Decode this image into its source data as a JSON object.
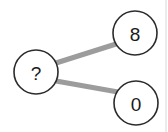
{
  "figure": {
    "type": "node-link-diagram",
    "title": "",
    "background_color": "#ffffff",
    "width": 168,
    "height": 132
  },
  "style": {
    "node_fill": "#ffffff",
    "node_stroke": "#2b2b2b",
    "node_stroke_width": 1.6,
    "node_radius": 22,
    "label_color": "#1a1a1a",
    "label_font_size": 19,
    "edge_color": "#9c9c9c",
    "edge_width": 5,
    "frame_color": "#d8d8d8"
  },
  "nodes": [
    {
      "id": "root",
      "label": "?",
      "cx": 36,
      "cy": 72,
      "r": 22
    },
    {
      "id": "child-top",
      "label": "8",
      "cx": 135,
      "cy": 33,
      "r": 22
    },
    {
      "id": "child-bottom",
      "label": "0",
      "cx": 136,
      "cy": 103,
      "r": 22
    }
  ],
  "edges": [
    {
      "id": "edge-root-to-8",
      "from": "root",
      "to": "child-top",
      "x1": 56,
      "y1": 63,
      "x2": 116,
      "y2": 44
    },
    {
      "id": "edge-root-to-0",
      "from": "root",
      "to": "child-bottom",
      "x1": 56,
      "y1": 81,
      "x2": 118,
      "y2": 92
    }
  ],
  "frame": {
    "right_rule_x": 166
  }
}
